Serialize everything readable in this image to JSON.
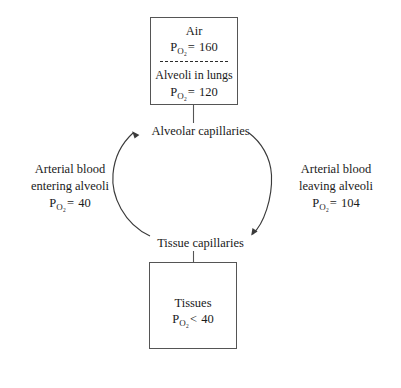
{
  "diagram": {
    "stroke_color": "#555555",
    "text_color": "#1a1a1a",
    "background": "#ffffff",
    "top_box": {
      "upper": {
        "label": "Air",
        "symbol": "P",
        "subscript": "O₂",
        "operator": "=",
        "value": "160"
      },
      "divider": "dashed",
      "lower": {
        "label": "Alveoli in lungs",
        "symbol": "P",
        "subscript": "O₂",
        "operator": "=",
        "value": "120"
      }
    },
    "bottom_box": {
      "label": "Tissues",
      "symbol": "P",
      "subscript": "O₂",
      "operator": "<",
      "value": "40"
    },
    "nodes": {
      "alveolar_capillaries": "Alveolar capillaries",
      "tissue_capillaries": "Tissue capillaries"
    },
    "left_branch": {
      "line1": "Arterial blood",
      "line2": "entering alveoli",
      "symbol": "P",
      "subscript": "O₂",
      "operator": "=",
      "value": "40"
    },
    "right_branch": {
      "line1": "Arterial blood",
      "line2": "leaving alveoli",
      "symbol": "P",
      "subscript": "O₂",
      "operator": "=",
      "value": "104"
    }
  }
}
